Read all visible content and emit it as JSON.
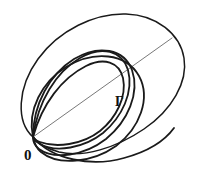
{
  "figure": {
    "kind": "geometric-line-diagram",
    "width": 198,
    "height": 175,
    "background_color": "#ffffff",
    "ink_color": "#1a1a1a",
    "faint_ink_color": "#555555",
    "labels": {
      "origin": "0",
      "boundary_curve": "Γ"
    },
    "label_positions": {
      "origin": {
        "x": 24,
        "y": 160
      },
      "boundary_curve": {
        "x": 115,
        "y": 106
      }
    }
  },
  "chart_data": {
    "type": "line",
    "title": "",
    "xlabel": "",
    "ylabel": "",
    "grid": false,
    "legend": "none",
    "xlim": [
      0,
      198
    ],
    "ylim": [
      0,
      175
    ],
    "annotations": [
      {
        "text": "0",
        "x": 24,
        "y": 160,
        "role": "origin-point-label"
      },
      {
        "text": "Γ",
        "x": 115,
        "y": 106,
        "role": "outer-curve-label"
      }
    ],
    "common_point": {
      "x": 33,
      "y": 137,
      "label": "0"
    },
    "series": [
      {
        "name": "outer-ellipse",
        "role": "boundary-region",
        "closed": true,
        "stroke_width": 1.5,
        "path": "M 33 137 C 16 122 17 88 38 59 C 59 30 95 13 126 14 C 157 15 180 34 184 58 C 188 82 172 110 144 129 C 116 148 83 158 59 152 C 45 148 37 143 33 137 Z"
      },
      {
        "name": "chord-diagonal",
        "role": "faint-diagonal-chord",
        "closed": false,
        "stroke_width": 0.8,
        "path": "M 33 137 L 172 38"
      },
      {
        "name": "loop-1-innermost",
        "role": "nested-loop",
        "closed": true,
        "stroke_width": 1.8,
        "path": "M 33 137 C 42 104 62 78 86 66 C 104 57 119 62 123 78 C 127 97 116 118 100 131 C 82 145 56 148 40 142 C 36 141 34 139 33 137 Z"
      },
      {
        "name": "loop-2",
        "role": "nested-loop",
        "closed": true,
        "stroke_width": 1.8,
        "path": "M 33 137 C 38 101 56 72 80 58 C 102 45 122 51 128 70 C 134 92 122 117 103 133 C 84 148 56 153 40 144 C 36 142 34 139 33 137 Z"
      },
      {
        "name": "loop-3",
        "role": "nested-loop",
        "closed": true,
        "stroke_width": 1.8,
        "path": "M 33 137 C 33 104 50 74 74 59 C 99 44 124 49 132 70 C 140 93 128 121 106 139 C 84 156 54 160 39 149 C 35 146 33 141 33 137 Z"
      },
      {
        "name": "loop-4-outermost",
        "role": "nested-loop",
        "closed": true,
        "stroke_width": 1.8,
        "path": "M 33 137 C 27 110 42 82 66 67 C 94 50 126 53 139 76 C 151 98 140 128 116 146 C 92 163 58 166 41 152 C 36 148 34 142 33 137 Z"
      },
      {
        "name": "lower-lens-arc",
        "role": "lower-bounding-arc",
        "closed": false,
        "stroke_width": 1.8,
        "path": "M 33 137 C 52 160 92 167 124 158 C 150 151 166 139 174 128"
      }
    ]
  }
}
